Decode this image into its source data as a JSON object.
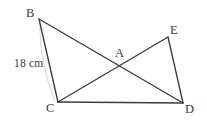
{
  "figure": {
    "background_color": "#ffffff",
    "stroke_color": "#3b3b3b",
    "artifact_color": "#d9d9d9",
    "stroke_width": 1.35,
    "width": 207,
    "height": 123,
    "points": {
      "B": {
        "x": 39,
        "y": 19,
        "label": "B",
        "label_x": 26,
        "label_y": 7
      },
      "C": {
        "x": 58,
        "y": 102,
        "label": "C",
        "label_x": 46,
        "label_y": 102
      },
      "A": {
        "x": 120,
        "y": 66,
        "label": "A",
        "label_x": 115,
        "label_y": 47
      },
      "E": {
        "x": 168,
        "y": 37,
        "label": "E",
        "label_x": 170,
        "label_y": 24
      },
      "D": {
        "x": 183,
        "y": 103,
        "label": "D",
        "label_x": 185,
        "label_y": 103
      }
    },
    "segments": [
      {
        "name": "segment-bc",
        "from": "B",
        "to": "C"
      },
      {
        "name": "segment-bd",
        "from": "B",
        "to": "D"
      },
      {
        "name": "segment-ce",
        "from": "C",
        "to": "E"
      },
      {
        "name": "segment-cd",
        "from": "C",
        "to": "D"
      },
      {
        "name": "segment-ed",
        "from": "E",
        "to": "D"
      }
    ],
    "measures": [
      {
        "name": "measure-bc",
        "text": "18 cm",
        "x": 14,
        "y": 58,
        "applies_to": "segment-bc"
      }
    ]
  }
}
